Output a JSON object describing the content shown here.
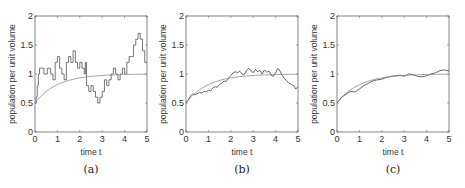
{
  "chart_data": [
    {
      "type": "line",
      "panel": "(a)",
      "xlabel": "time t",
      "ylabel": "population per unit volume",
      "xlim": [
        0,
        5
      ],
      "ylim": [
        0,
        2
      ],
      "xticks": [
        "0",
        "1",
        "2",
        "3",
        "4",
        "5"
      ],
      "yticks": [
        "0",
        "0.5",
        "1",
        "1.5",
        "2"
      ],
      "grid": false,
      "series": [
        {
          "name": "stochastic",
          "style": "step",
          "x": [
            0,
            0.05,
            0.1,
            0.15,
            0.2,
            0.3,
            0.4,
            0.55,
            0.7,
            0.8,
            0.9,
            1.0,
            1.1,
            1.2,
            1.3,
            1.4,
            1.5,
            1.6,
            1.7,
            1.8,
            1.9,
            2.0,
            2.1,
            2.2,
            2.25,
            2.3,
            2.4,
            2.5,
            2.6,
            2.7,
            2.8,
            2.9,
            3.0,
            3.1,
            3.2,
            3.3,
            3.4,
            3.5,
            3.6,
            3.7,
            3.8,
            3.9,
            4.0,
            4.1,
            4.2,
            4.3,
            4.4,
            4.5,
            4.6,
            4.7,
            4.8,
            4.9,
            5.0
          ],
          "y": [
            0.5,
            0.6,
            0.8,
            1.0,
            1.1,
            1.1,
            1.0,
            1.1,
            1.0,
            0.9,
            1.2,
            1.3,
            1.1,
            1.0,
            0.9,
            1.2,
            1.3,
            1.2,
            1.4,
            1.2,
            1.1,
            1.2,
            1.1,
            1.0,
            1.2,
            0.8,
            0.7,
            0.8,
            0.7,
            0.6,
            0.5,
            0.6,
            0.7,
            0.9,
            0.8,
            0.9,
            1.0,
            1.1,
            1.0,
            0.9,
            1.0,
            1.1,
            1.0,
            1.2,
            1.3,
            1.3,
            1.5,
            1.6,
            1.7,
            1.6,
            1.4,
            1.2,
            1.2
          ]
        },
        {
          "name": "deterministic",
          "style": "smooth",
          "formula": "1 - 0.5*exp(-t)"
        }
      ]
    },
    {
      "type": "line",
      "panel": "(b)",
      "xlabel": "time t",
      "ylabel": "population per unit volume",
      "xlim": [
        0,
        5
      ],
      "ylim": [
        0,
        2
      ],
      "xticks": [
        "0",
        "1",
        "2",
        "3",
        "4",
        "5"
      ],
      "yticks": [
        "0",
        "0.5",
        "1",
        "1.5",
        "2"
      ],
      "grid": false,
      "series": [
        {
          "name": "stochastic",
          "style": "jagged",
          "x": [
            0,
            0.1,
            0.2,
            0.3,
            0.4,
            0.5,
            0.6,
            0.7,
            0.8,
            0.9,
            1.0,
            1.1,
            1.2,
            1.3,
            1.4,
            1.5,
            1.6,
            1.7,
            1.8,
            1.9,
            2.0,
            2.1,
            2.2,
            2.3,
            2.4,
            2.5,
            2.6,
            2.7,
            2.8,
            2.9,
            3.0,
            3.1,
            3.2,
            3.3,
            3.4,
            3.5,
            3.6,
            3.7,
            3.8,
            3.9,
            4.0,
            4.1,
            4.2,
            4.3,
            4.4,
            4.5,
            4.6,
            4.7,
            4.8,
            4.9,
            5.0
          ],
          "y": [
            0.5,
            0.55,
            0.62,
            0.66,
            0.64,
            0.66,
            0.68,
            0.67,
            0.7,
            0.69,
            0.72,
            0.71,
            0.76,
            0.78,
            0.77,
            0.82,
            0.84,
            0.88,
            0.87,
            0.93,
            0.97,
            1.02,
            1.04,
            1.02,
            1.05,
            1.0,
            0.99,
            1.06,
            1.1,
            1.06,
            1.02,
            1.08,
            1.04,
            1.06,
            1.0,
            1.07,
            1.03,
            1.05,
            0.98,
            0.96,
            1.02,
            1.1,
            1.05,
            0.97,
            0.92,
            0.88,
            0.84,
            0.82,
            0.8,
            0.74,
            0.78
          ]
        },
        {
          "name": "deterministic",
          "style": "smooth",
          "formula": "1 - 0.5*exp(-t)"
        }
      ]
    },
    {
      "type": "line",
      "panel": "(c)",
      "xlabel": "time t",
      "ylabel": "population per unit volume",
      "xlim": [
        0,
        5
      ],
      "ylim": [
        0,
        2
      ],
      "xticks": [
        "0",
        "1",
        "2",
        "3",
        "4",
        "5"
      ],
      "yticks": [
        "0",
        "0.5",
        "1",
        "1.5",
        "2"
      ],
      "grid": false,
      "series": [
        {
          "name": "stochastic",
          "style": "jagged",
          "x": [
            0,
            0.2,
            0.4,
            0.6,
            0.8,
            1.0,
            1.2,
            1.4,
            1.6,
            1.8,
            2.0,
            2.2,
            2.4,
            2.6,
            2.8,
            3.0,
            3.2,
            3.4,
            3.6,
            3.8,
            4.0,
            4.2,
            4.4,
            4.6,
            4.8,
            5.0
          ],
          "y": [
            0.5,
            0.6,
            0.65,
            0.7,
            0.69,
            0.74,
            0.8,
            0.84,
            0.88,
            0.9,
            0.91,
            0.94,
            0.96,
            0.97,
            0.98,
            0.96,
            1.0,
            0.99,
            0.96,
            0.95,
            0.97,
            1.0,
            1.02,
            1.06,
            1.07,
            1.05
          ]
        },
        {
          "name": "deterministic",
          "style": "smooth",
          "formula": "1 - 0.5*exp(-t)"
        }
      ]
    }
  ],
  "panels": [
    {
      "caption": "(a)",
      "xlabel": "time t",
      "ylabel": "population per unit volume"
    },
    {
      "caption": "(b)",
      "xlabel": "time t",
      "ylabel": "population per unit volume"
    },
    {
      "caption": "(c)",
      "xlabel": "time t",
      "ylabel": "population per unit volume"
    }
  ],
  "colors": {
    "axis": "#666666",
    "stochastic": "#555555",
    "deterministic": "#888888"
  }
}
